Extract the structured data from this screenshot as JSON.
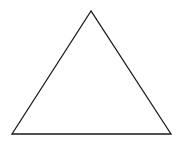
{
  "diagram": {
    "shape": "triangle",
    "stroke_color": "#1a1a1a",
    "fill_color": "#ffffff",
    "vertices": [
      [
        91,
        11
      ],
      [
        12,
        134
      ],
      [
        171,
        134
      ]
    ]
  }
}
